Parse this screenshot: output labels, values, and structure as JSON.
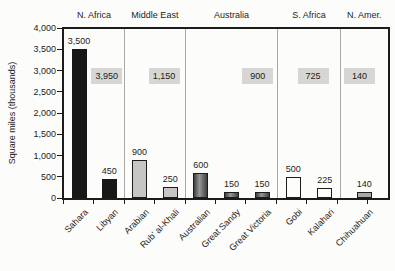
{
  "chart_data": {
    "type": "bar",
    "title": "",
    "xlabel": "",
    "ylabel": "Square miles (thousands)",
    "ylim": [
      0,
      4000
    ],
    "ytick_step": 500,
    "ytick_labels": [
      "0",
      "500",
      "1,000",
      "1,500",
      "2,000",
      "2,500",
      "3,000",
      "3,500",
      "4,000"
    ],
    "grid": false,
    "legend_position": "none",
    "regions": [
      {
        "name": "N. Africa",
        "total": 3950,
        "total_label": "3,950",
        "bars": [
          {
            "category": "Sahara",
            "value": 3500,
            "value_label": "3,500",
            "style": "solid-black"
          },
          {
            "category": "Libyan",
            "value": 450,
            "value_label": "450",
            "style": "solid-black"
          }
        ]
      },
      {
        "name": "Middle East",
        "total": 1150,
        "total_label": "1,150",
        "bars": [
          {
            "category": "Arabian",
            "value": 900,
            "value_label": "900",
            "style": "light-gray"
          },
          {
            "category": "Rub' al-Khali",
            "value": 250,
            "value_label": "250",
            "style": "light-gray"
          }
        ]
      },
      {
        "name": "Australia",
        "total": 900,
        "total_label": "900",
        "bars": [
          {
            "category": "Australian",
            "value": 600,
            "value_label": "600",
            "style": "dark-gradient"
          },
          {
            "category": "Great Sandy",
            "value": 150,
            "value_label": "150",
            "style": "dark-gradient"
          },
          {
            "category": "Great Victoria",
            "value": 150,
            "value_label": "150",
            "style": "dark-gradient"
          }
        ]
      },
      {
        "name": "S. Africa",
        "total": 725,
        "total_label": "725",
        "bars": [
          {
            "category": "Gobi",
            "value": 500,
            "value_label": "500",
            "style": "white-outline"
          },
          {
            "category": "Kalahari",
            "value": 225,
            "value_label": "225",
            "style": "white-outline"
          }
        ]
      },
      {
        "name": "N. Amer.",
        "total": 140,
        "total_label": "140",
        "bars": [
          {
            "category": "Chihuahuan",
            "value": 140,
            "value_label": "140",
            "style": "medium-gray"
          }
        ]
      }
    ],
    "colors": {
      "frame": "#1c1c1c",
      "separator": "#a9a9a9",
      "text": "#1c1c1c",
      "total_box_bg": "#d6d6d4",
      "solid_black": "#171717",
      "light_gray": "#c6c6c4",
      "dark_gradient_edge": "#3f3f3f",
      "dark_gradient_mid": "#979797",
      "white_outline": "#fdfdfc",
      "medium_gray": "#a9a9a6"
    },
    "layout": {
      "region_width_frac": [
        0.186,
        0.189,
        0.2835,
        0.195,
        0.1465
      ]
    }
  }
}
